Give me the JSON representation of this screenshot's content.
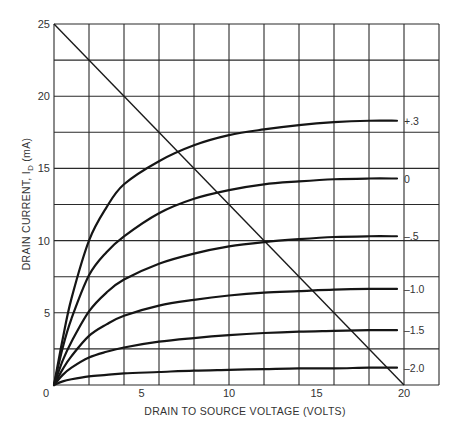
{
  "chart_data": {
    "type": "line",
    "title": "",
    "xlabel": "DRAIN TO SOURCE VOLTAGE (VOLTS)",
    "ylabel": "DRAIN CURRENT, I_D (mA)",
    "ylabel_parts": {
      "main": "DRAIN CURRENT, I",
      "subscript": "D",
      "unit": " (mA)"
    },
    "xlim": [
      0,
      22
    ],
    "ylim": [
      0,
      25
    ],
    "x_grid_step": 2,
    "y_grid_step": 2.5,
    "grid": true,
    "x_ticks": [
      {
        "value": 0,
        "label": "0"
      },
      {
        "value": 5,
        "label": "5"
      },
      {
        "value": 10,
        "label": "10"
      },
      {
        "value": 15,
        "label": "15"
      },
      {
        "value": 20,
        "label": "20"
      }
    ],
    "y_ticks": [
      {
        "value": 5,
        "label": "5"
      },
      {
        "value": 10,
        "label": "10"
      },
      {
        "value": 15,
        "label": "15"
      },
      {
        "value": 20,
        "label": "20"
      },
      {
        "value": 25,
        "label": "25"
      }
    ],
    "legend_position": "inline-right",
    "series": [
      {
        "name": "+.3",
        "label": "+.3",
        "x": [
          0,
          0.5,
          1,
          2,
          3,
          4,
          6,
          8,
          10,
          12,
          14,
          16,
          18,
          19.6
        ],
        "y": [
          0,
          3.2,
          6,
          10,
          12.3,
          13.9,
          15.5,
          16.6,
          17.3,
          17.7,
          18.0,
          18.2,
          18.3,
          18.3
        ]
      },
      {
        "name": "0",
        "label": "0",
        "x": [
          0,
          0.5,
          1,
          2,
          3,
          4,
          6,
          8,
          10,
          12,
          14,
          16,
          18,
          19.6
        ],
        "y": [
          0,
          2.6,
          4.6,
          7.6,
          9.2,
          10.3,
          11.9,
          12.9,
          13.5,
          13.9,
          14.1,
          14.25,
          14.3,
          14.3
        ]
      },
      {
        "name": "-.5",
        "label": "–.5",
        "x": [
          0,
          0.5,
          1,
          2,
          3,
          4,
          6,
          8,
          10,
          12,
          14,
          16,
          18,
          19.6
        ],
        "y": [
          0,
          1.7,
          3.0,
          5.1,
          6.4,
          7.3,
          8.4,
          9.1,
          9.6,
          9.9,
          10.1,
          10.25,
          10.3,
          10.3
        ]
      },
      {
        "name": "-1.0",
        "label": "–1.0",
        "x": [
          0,
          0.5,
          1,
          2,
          3,
          4,
          6,
          8,
          10,
          12,
          14,
          16,
          18,
          19.6
        ],
        "y": [
          0,
          1.1,
          2.0,
          3.4,
          4.2,
          4.8,
          5.5,
          5.9,
          6.2,
          6.4,
          6.5,
          6.6,
          6.65,
          6.65
        ]
      },
      {
        "name": "-1.5",
        "label": "–1.5",
        "x": [
          0,
          0.5,
          1,
          2,
          3,
          4,
          6,
          8,
          10,
          12,
          14,
          16,
          18,
          19.6
        ],
        "y": [
          0,
          0.7,
          1.2,
          1.9,
          2.3,
          2.6,
          3.0,
          3.25,
          3.45,
          3.6,
          3.7,
          3.75,
          3.8,
          3.8
        ]
      },
      {
        "name": "-2.0",
        "label": "–2.0",
        "x": [
          0,
          0.5,
          1,
          2,
          3,
          4,
          6,
          8,
          10,
          12,
          14,
          16,
          18,
          19.6
        ],
        "y": [
          0,
          0.25,
          0.4,
          0.6,
          0.7,
          0.8,
          0.9,
          1.0,
          1.05,
          1.1,
          1.15,
          1.15,
          1.2,
          1.2
        ]
      }
    ],
    "annotations": [
      {
        "type": "load_line",
        "x": [
          0,
          20
        ],
        "y": [
          25,
          0
        ]
      }
    ]
  }
}
